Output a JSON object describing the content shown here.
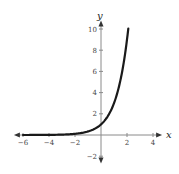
{
  "chart_data": {
    "type": "line",
    "title": "",
    "xlabel": "x",
    "ylabel": "y",
    "xlim": [
      -6.7,
      4.7
    ],
    "ylim": [
      -2.7,
      10.8
    ],
    "grid": false,
    "legend": "none",
    "x_ticks": [
      -6,
      -4,
      -2,
      2,
      4
    ],
    "x_tick_labels": [
      "−6",
      "−4",
      "−2",
      "2",
      "4"
    ],
    "y_ticks": [
      -2,
      2,
      4,
      6,
      8,
      10
    ],
    "y_tick_labels": [
      "−2",
      "2",
      "4",
      "6",
      "8",
      "10"
    ],
    "series": [
      {
        "name": "y = 3^x",
        "function": "3^x",
        "domain": [
          -6,
          2.1
        ],
        "color": "#1a1a1a"
      }
    ]
  }
}
